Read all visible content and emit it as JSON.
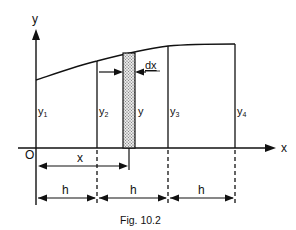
{
  "axes": {
    "x_label": "x",
    "y_label": "y",
    "origin_label": "O"
  },
  "ordinates": [
    {
      "label": "y",
      "sub": "1"
    },
    {
      "label": "y",
      "sub": "2"
    },
    {
      "label": "y",
      "sub": "3"
    },
    {
      "label": "y",
      "sub": "4"
    }
  ],
  "strip": {
    "height_label": "y",
    "width_label": "dx"
  },
  "dimensions": {
    "x_label": "x",
    "h_labels": [
      "h",
      "h",
      "h"
    ]
  },
  "caption": "Fig. 10.2",
  "colors": {
    "ink": "#111111",
    "background": "#ffffff"
  }
}
